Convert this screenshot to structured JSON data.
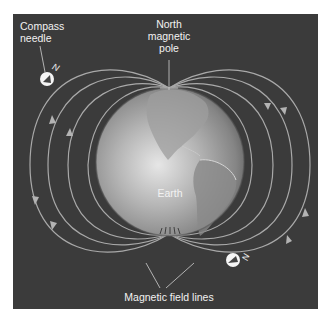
{
  "diagram": {
    "labels": {
      "compass_needle": "Compass\nneedle",
      "north_pole": "North\nmagnetic\npole",
      "earth": "Earth",
      "field_lines": "Magnetic field lines"
    },
    "compass_marks": [
      "N",
      "N"
    ],
    "colors": {
      "background": "#3b3b3b",
      "field_line": "#a9a9a9",
      "label_text": "#f2f2f2",
      "globe_light": "#d8d8d8",
      "globe_dark": "#6e6e6e"
    }
  }
}
